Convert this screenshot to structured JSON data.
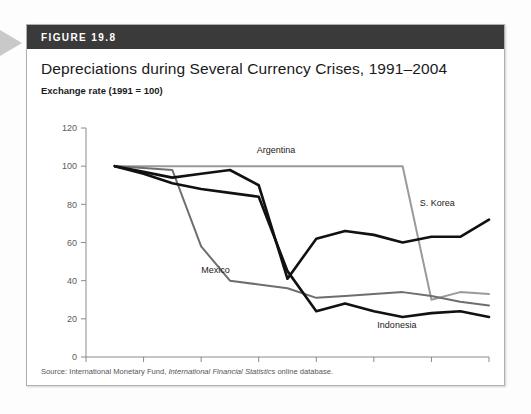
{
  "figure": {
    "header_label": "FIGURE 19.8",
    "title": "Depreciations during Several Currency Crises, 1991–2004",
    "axis_note": "Exchange rate (1991 = 100)",
    "source": "Source: International Monetary Fund, International Financial Statistics online database.",
    "source_prefix": "Source: International Monetary Fund, ",
    "source_italic": "International Financial Statistics",
    "source_suffix": " online database."
  },
  "colors": {
    "header_bg": "#3a3a3a",
    "argentina": "#9a9a9a",
    "mexico": "#6e6e6e",
    "s_korea": "#111111",
    "indonesia": "#111111",
    "axis": "#8a8a8a",
    "box_border": "#b0b0b0"
  },
  "chart_data": {
    "type": "line",
    "title": "Depreciations during Several Currency Crises, 1991–2004",
    "xlabel": "Year",
    "ylabel": "Exchange rate (1991 = 100)",
    "xlim": [
      1990,
      2004
    ],
    "ylim": [
      0,
      120
    ],
    "xticks": [
      1990,
      1992,
      1994,
      1996,
      1998,
      2000,
      2002,
      2004
    ],
    "xtick_labels": [
      "1990",
      "1992",
      "1994",
      "1996",
      "1998",
      "2000",
      "2002",
      "2004"
    ],
    "yticks": [
      0,
      20,
      40,
      60,
      80,
      100,
      120
    ],
    "ytick_labels": [
      "0",
      "20",
      "40",
      "60",
      "80",
      "100",
      "120"
    ],
    "grid": false,
    "legend": "inline-labels",
    "x": [
      1991,
      1992,
      1993,
      1994,
      1995,
      1996,
      1997,
      1998,
      1999,
      2000,
      2001,
      2002,
      2003,
      2004
    ],
    "series": [
      {
        "name": "Argentina",
        "color": "#9a9a9a",
        "label_x": 1996.6,
        "label_y": 107,
        "values": [
          100,
          100,
          100,
          100,
          100,
          100,
          100,
          100,
          100,
          100,
          100,
          30,
          34,
          33
        ]
      },
      {
        "name": "Mexico",
        "color": "#6e6e6e",
        "label_x": 1994.5,
        "label_y": 44,
        "values": [
          100,
          99,
          98,
          58,
          40,
          38,
          36,
          31,
          32,
          33,
          34,
          32,
          29,
          27
        ]
      },
      {
        "name": "S. Korea",
        "color": "#111111",
        "label_x": 2002.2,
        "label_y": 79,
        "values": [
          100,
          97,
          94,
          96,
          98,
          90,
          41,
          62,
          66,
          64,
          60,
          63,
          63,
          72
        ]
      },
      {
        "name": "Indonesia",
        "color": "#111111",
        "label_x": 2000.8,
        "label_y": 15,
        "values": [
          100,
          96,
          91,
          88,
          86,
          84,
          45,
          24,
          28,
          24,
          21,
          23,
          24,
          21
        ]
      }
    ]
  }
}
